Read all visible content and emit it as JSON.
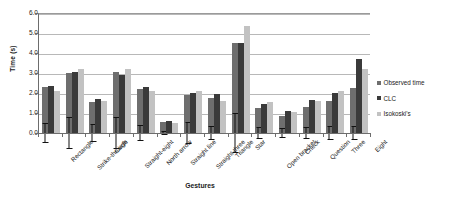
{
  "chart_data": {
    "type": "bar",
    "title": "",
    "xlabel": "Gestures",
    "ylabel": "Time (s)",
    "ylim": [
      0,
      6
    ],
    "yticks": [
      0.0,
      1.0,
      2.0,
      3.0,
      4.0,
      5.0,
      6.0
    ],
    "ytick_labels": [
      "0.0",
      "1.0",
      "2.0",
      "3.0",
      "4.0",
      "5.0",
      "6.0"
    ],
    "grid": true,
    "legend_position": "right",
    "categories": [
      "Rectangle",
      "Strike-through",
      "Circle",
      "Straight-eight",
      "North arrow",
      "Straight line",
      "Straight-three",
      "Triangle",
      "Star",
      "Open bracket",
      "Check",
      "Question",
      "Three",
      "Eight"
    ],
    "series": [
      {
        "name": "Observed time",
        "color": "#6e6e6e",
        "values": [
          2.3,
          3.0,
          1.55,
          3.05,
          2.2,
          0.55,
          1.9,
          1.75,
          4.5,
          1.25,
          0.85,
          1.3,
          1.6,
          2.25
        ],
        "errors": [
          0.5,
          0.8,
          0.45,
          0.8,
          0.4,
          0.1,
          0.55,
          0.35,
          1.0,
          0.3,
          0.25,
          0.3,
          0.35,
          0.35
        ]
      },
      {
        "name": "CLC",
        "color": "#3a3a3a",
        "values": [
          2.35,
          3.05,
          1.7,
          2.9,
          2.3,
          0.6,
          2.0,
          1.95,
          4.5,
          1.45,
          1.1,
          1.65,
          2.0,
          3.7
        ]
      },
      {
        "name": "Isokoski's",
        "color": "#c2c2c2",
        "values": [
          2.1,
          3.2,
          1.6,
          3.2,
          2.1,
          0.5,
          2.1,
          1.6,
          5.35,
          1.55,
          1.05,
          1.6,
          2.1,
          3.2
        ]
      }
    ]
  }
}
